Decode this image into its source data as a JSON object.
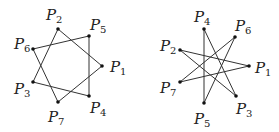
{
  "figures": [
    {
      "name": "heptagram-7-2",
      "points": [
        {
          "id": "P1",
          "letter": "P",
          "sub": "1",
          "x": 102,
          "y": 66,
          "lx": 110,
          "ly": 72
        },
        {
          "id": "P2",
          "letter": "P",
          "sub": "2",
          "x": 58,
          "y": 29,
          "lx": 46,
          "ly": 20
        },
        {
          "id": "P3",
          "letter": "P",
          "sub": "3",
          "x": 33,
          "y": 82,
          "lx": 14,
          "ly": 94
        },
        {
          "id": "P4",
          "letter": "P",
          "sub": "4",
          "x": 89,
          "y": 96,
          "lx": 90,
          "ly": 113
        },
        {
          "id": "P5",
          "letter": "P",
          "sub": "5",
          "x": 89,
          "y": 36,
          "lx": 90,
          "ly": 30
        },
        {
          "id": "P6",
          "letter": "P",
          "sub": "6",
          "x": 33,
          "y": 49,
          "lx": 14,
          "ly": 49
        },
        {
          "id": "P7",
          "letter": "P",
          "sub": "7",
          "x": 58,
          "y": 102,
          "lx": 48,
          "ly": 122
        }
      ],
      "edges": [
        [
          "P2",
          "P1"
        ],
        [
          "P1",
          "P7"
        ],
        [
          "P7",
          "P6"
        ],
        [
          "P6",
          "P5"
        ],
        [
          "P5",
          "P4"
        ],
        [
          "P4",
          "P3"
        ],
        [
          "P3",
          "P2"
        ]
      ]
    },
    {
      "name": "heptagram-7-3",
      "points": [
        {
          "id": "P1",
          "letter": "P",
          "sub": "1",
          "x": 249,
          "y": 66,
          "lx": 255,
          "ly": 73
        },
        {
          "id": "P2",
          "letter": "P",
          "sub": "2",
          "x": 180,
          "y": 50,
          "lx": 160,
          "ly": 51
        },
        {
          "id": "P3",
          "letter": "P",
          "sub": "3",
          "x": 236,
          "y": 96,
          "lx": 236,
          "ly": 114
        },
        {
          "id": "P4",
          "letter": "P",
          "sub": "4",
          "x": 204,
          "y": 29,
          "lx": 194,
          "ly": 22
        },
        {
          "id": "P5",
          "letter": "P",
          "sub": "5",
          "x": 204,
          "y": 103,
          "lx": 194,
          "ly": 124
        },
        {
          "id": "P6",
          "letter": "P",
          "sub": "6",
          "x": 235,
          "y": 37,
          "lx": 235,
          "ly": 31
        },
        {
          "id": "P7",
          "letter": "P",
          "sub": "7",
          "x": 180,
          "y": 82,
          "lx": 160,
          "ly": 93
        }
      ],
      "edges": [
        [
          "P4",
          "P5"
        ],
        [
          "P4",
          "P3"
        ],
        [
          "P6",
          "P7"
        ],
        [
          "P6",
          "P5"
        ],
        [
          "P2",
          "P1"
        ],
        [
          "P2",
          "P3"
        ],
        [
          "P7",
          "P1"
        ]
      ]
    }
  ]
}
